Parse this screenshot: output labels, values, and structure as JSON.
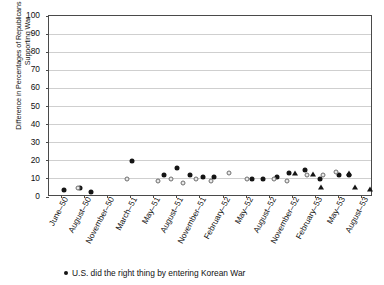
{
  "chart_data": {
    "type": "scatter",
    "title": "",
    "xlabel": "",
    "ylabel": "Difference in Percentages of Republicans and Democrats Supporting War",
    "ylim": [
      0,
      100
    ],
    "yticks": [
      0,
      10,
      20,
      30,
      40,
      50,
      60,
      70,
      80,
      90,
      100
    ],
    "grid": true,
    "legend_position": "bottom-left",
    "categories": [
      "June–50",
      "August–50",
      "November–50",
      "March–51",
      "May–51",
      "August–51",
      "November–51",
      "February–52",
      "May–52",
      "August–52",
      "November–52",
      "February–53",
      "May–53",
      "August–53"
    ],
    "series": [
      {
        "name": "U.S. did the right thing by entering Korean War",
        "marker": "circle-filled",
        "color": "#151515",
        "points": [
          {
            "x": 4.5,
            "y": 4
          },
          {
            "x": 9.5,
            "y": 5
          },
          {
            "x": 13.0,
            "y": 3
          },
          {
            "x": 25.5,
            "y": 20
          },
          {
            "x": 35.5,
            "y": 12
          },
          {
            "x": 39.5,
            "y": 16
          },
          {
            "x": 43.5,
            "y": 12
          },
          {
            "x": 47.5,
            "y": 11
          },
          {
            "x": 51.0,
            "y": 11
          },
          {
            "x": 62.5,
            "y": 10
          },
          {
            "x": 66.0,
            "y": 10
          },
          {
            "x": 70.5,
            "y": 11
          },
          {
            "x": 74.0,
            "y": 13
          },
          {
            "x": 79.0,
            "y": 15
          },
          {
            "x": 83.5,
            "y": 10
          },
          {
            "x": 89.5,
            "y": 12
          },
          {
            "x": 92.5,
            "y": 12
          }
        ]
      },
      {
        "name": "Approve of the way President is handling the Korean War",
        "marker": "circle-open",
        "color": "#6e6e6e",
        "points": [
          {
            "x": 9.0,
            "y": 5
          },
          {
            "x": 24.0,
            "y": 10
          },
          {
            "x": 33.5,
            "y": 9
          },
          {
            "x": 37.5,
            "y": 10
          },
          {
            "x": 41.5,
            "y": 8
          },
          {
            "x": 45.5,
            "y": 10
          },
          {
            "x": 50.0,
            "y": 9
          },
          {
            "x": 55.5,
            "y": 13
          },
          {
            "x": 61.0,
            "y": 10
          },
          {
            "x": 69.5,
            "y": 10
          },
          {
            "x": 73.5,
            "y": 9
          },
          {
            "x": 79.5,
            "y": 12
          },
          {
            "x": 84.5,
            "y": 12
          },
          {
            "x": 88.5,
            "y": 14
          }
        ]
      },
      {
        "name": "Korean War triangles series",
        "marker": "triangle",
        "color": "#151515",
        "points": [
          {
            "x": 76.0,
            "y": 14
          },
          {
            "x": 81.5,
            "y": 13
          },
          {
            "x": 84.0,
            "y": 6
          },
          {
            "x": 92.5,
            "y": 14
          },
          {
            "x": 94.5,
            "y": 6
          },
          {
            "x": 99.0,
            "y": 5
          }
        ]
      }
    ]
  },
  "legend": {
    "entries": [
      {
        "marker": "circle-filled",
        "label": "U.S. did the right thing by entering Korean War"
      }
    ]
  }
}
